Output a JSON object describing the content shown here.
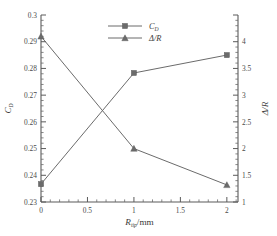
{
  "chart_data": {
    "type": "line",
    "title": "",
    "xlabel": "R_tip/mm",
    "xlabel_main": "R",
    "xlabel_sub": "tip",
    "xlabel_unit": "/mm",
    "ylabel_left": "C_D",
    "ylabel_left_main": "C",
    "ylabel_left_sub": "D",
    "ylabel_right": "Δ/R",
    "x": [
      0,
      1,
      2
    ],
    "xlim": [
      0,
      2.12
    ],
    "xticks": [
      0,
      0.5,
      1,
      1.5,
      2
    ],
    "xtick_labels": [
      "0",
      "0.5",
      "1",
      "1.5",
      "2"
    ],
    "x_minor_count": 5,
    "left_axis": {
      "label": "C_D",
      "ylim": [
        0.23,
        0.3
      ],
      "ticks": [
        0.23,
        0.24,
        0.25,
        0.26,
        0.27,
        0.28,
        0.29,
        0.3
      ],
      "tick_labels": [
        "0.23",
        "0.24",
        "0.25",
        "0.26",
        "0.27",
        "0.28",
        "0.29",
        "0.3"
      ],
      "minor_count": 5
    },
    "right_axis": {
      "label": "Δ/R",
      "ylim": [
        1,
        4.5
      ],
      "ticks": [
        1,
        1.5,
        2,
        2.5,
        3,
        3.5,
        4,
        4.5
      ],
      "tick_labels": [
        "1",
        "1.5",
        "2",
        "2.5",
        "3",
        "3.5",
        "4",
        ""
      ],
      "minor_count": 5
    },
    "grid": false,
    "legend_position": "top-center",
    "series": [
      {
        "name": "C_D",
        "legend_label": "C_D",
        "legend_main": "C",
        "legend_sub": "D",
        "axis": "left",
        "marker": "square",
        "color": "#6b6b6b",
        "values": [
          0.2367,
          0.2783,
          0.285
        ]
      },
      {
        "name": "Δ/R",
        "legend_label": "Δ/R",
        "axis": "right",
        "marker": "triangle",
        "color": "#6b6b6b",
        "values": [
          4.1,
          2.0,
          1.32
        ]
      }
    ]
  },
  "colors": {
    "background": "#ffffff",
    "axis": "#5a5a5a",
    "series": "#6b6b6b",
    "text": "#3a3a3a"
  }
}
